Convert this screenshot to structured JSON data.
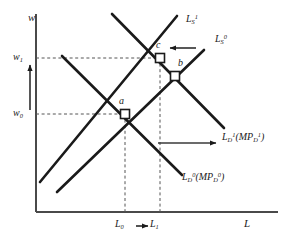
{
  "figure": {
    "kind": "labor-market-supply-demand-diagram",
    "background": "#ffffff",
    "ink": "#1a1a1a",
    "guide_color": "#555555"
  },
  "axes": {
    "y_label": "w",
    "x_label": "L",
    "origin": {
      "x": 36,
      "y": 212
    },
    "y_top": 14,
    "x_right": 278
  },
  "ticks": {
    "y": [
      {
        "id": "w0",
        "base": "w",
        "sub": "0",
        "value_px": 114
      },
      {
        "id": "w1",
        "base": "w",
        "sub": "1",
        "value_px": 58
      }
    ],
    "x": [
      {
        "id": "L0",
        "base": "L",
        "sub": "0",
        "value_px": 125
      },
      {
        "id": "L1",
        "base": "L",
        "sub": "1",
        "value_px": 160
      }
    ],
    "x_arrow_glyph": "→"
  },
  "curves": [
    {
      "id": "supply-0",
      "label_base": "L",
      "label_sub": "S",
      "label_sup": "0",
      "label_paren": "",
      "type": "supply",
      "slope": "upward",
      "x1": 57,
      "y1": 192,
      "x2": 204,
      "y2": 50,
      "label_x": 211,
      "label_y": 38
    },
    {
      "id": "supply-1",
      "label_base": "L",
      "label_sub": "S",
      "label_sup": "1",
      "label_paren": "",
      "type": "supply",
      "slope": "upward",
      "x1": 40,
      "y1": 182,
      "x2": 177,
      "y2": 16,
      "label_x": 186,
      "label_y": 19
    },
    {
      "id": "demand-0",
      "label_base": "L",
      "label_sub": "D",
      "label_sup": "0",
      "label_paren": "(MP",
      "paren_sub": "D",
      "paren_sup": "0",
      "paren_close": ")",
      "type": "demand",
      "slope": "downward",
      "x1": 62,
      "y1": 56,
      "x2": 182,
      "y2": 175,
      "label_x": 180,
      "label_y": 173
    },
    {
      "id": "demand-1",
      "label_base": "L",
      "label_sub": "D",
      "label_sup": "1",
      "label_paren": "(MP",
      "paren_sub": "D",
      "paren_sup": "1",
      "paren_close": ")",
      "type": "demand",
      "slope": "downward",
      "x1": 112,
      "y1": 14,
      "x2": 224,
      "y2": 128,
      "label_x": 221,
      "label_y": 131
    }
  ],
  "points": [
    {
      "id": "a",
      "label": "a",
      "x": 125,
      "y": 114,
      "label_x": 119,
      "label_y": 97
    },
    {
      "id": "b",
      "label": "b",
      "x": 175,
      "y": 76,
      "label_x": 177,
      "label_y": 59
    },
    {
      "id": "c",
      "label": "c",
      "x": 160,
      "y": 58,
      "label_x": 155,
      "label_y": 41
    }
  ],
  "shift_arrows": [
    {
      "id": "supply-shift-arrow",
      "direction": "left",
      "x1": 196,
      "y1": 48,
      "x2": 170,
      "y2": 48
    },
    {
      "id": "demand-shift-arrow",
      "direction": "right",
      "x1": 158,
      "y1": 143,
      "x2": 218,
      "y2": 143
    },
    {
      "id": "wage-rise-arrow",
      "direction": "up",
      "x1": 30,
      "y1": 110,
      "x2": 30,
      "y2": 63
    }
  ],
  "guides": [
    {
      "id": "guide-w0",
      "kind": "horizontal-dashed",
      "x1": 36,
      "y1": 114,
      "x2": 125,
      "y2": 114
    },
    {
      "id": "guide-w1",
      "kind": "horizontal-dashed",
      "x1": 36,
      "y1": 58,
      "x2": 160,
      "y2": 58
    },
    {
      "id": "guide-L0",
      "kind": "vertical-dashed",
      "x1": 125,
      "y1": 114,
      "x2": 125,
      "y2": 212
    },
    {
      "id": "guide-L1",
      "kind": "vertical-dashed",
      "x1": 160,
      "y1": 58,
      "x2": 160,
      "y2": 212
    }
  ]
}
